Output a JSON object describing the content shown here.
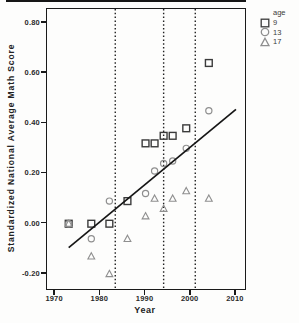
{
  "figure": {
    "y_axis_title": "Standardized National Average Math Score",
    "x_axis_title": "Year",
    "legend": {
      "title": "age",
      "items": [
        {
          "marker": "square",
          "label": "9",
          "color": "#3b3b3b"
        },
        {
          "marker": "circle",
          "label": "13",
          "color": "#8f8f8f"
        },
        {
          "marker": "triangle",
          "label": "17",
          "color": "#8f8f8f"
        }
      ]
    }
  },
  "chart_data": {
    "type": "scatter",
    "title": "",
    "xlabel": "Year",
    "ylabel": "Standardized National Average Math Score",
    "xlim": [
      1968.2,
      2012
    ],
    "ylim": [
      -0.26,
      0.855
    ],
    "xticks": [
      1970,
      1980,
      1990,
      2000,
      2010
    ],
    "xtick_labels": [
      "1970",
      "1980",
      "1990",
      "2000",
      "2010"
    ],
    "yticks": [
      0.8,
      0.6,
      0.4,
      0.2,
      0.0,
      -0.2
    ],
    "ytick_labels": [
      "0.80",
      "0.60",
      "0.40",
      "0.20",
      "0.00",
      "-0.20"
    ],
    "grid": false,
    "legend_position": "top-right-outside",
    "series": [
      {
        "name": "9",
        "marker": "square",
        "color": "#3b3b3b",
        "points": [
          [
            1973,
            0.0
          ],
          [
            1978,
            0.0
          ],
          [
            1982,
            0.0
          ],
          [
            1986,
            0.09
          ],
          [
            1990,
            0.32
          ],
          [
            1992,
            0.32
          ],
          [
            1994,
            0.35
          ],
          [
            1996,
            0.35
          ],
          [
            1999,
            0.38
          ],
          [
            2004,
            0.64
          ]
        ]
      },
      {
        "name": "13",
        "marker": "circle",
        "color": "#8f8f8f",
        "points": [
          [
            1973,
            0.0
          ],
          [
            1978,
            -0.06
          ],
          [
            1982,
            0.09
          ],
          [
            1990,
            0.12
          ],
          [
            1992,
            0.21
          ],
          [
            1994,
            0.24
          ],
          [
            1996,
            0.25
          ],
          [
            1999,
            0.3
          ],
          [
            2004,
            0.45
          ]
        ]
      },
      {
        "name": "17",
        "marker": "triangle",
        "color": "#8f8f8f",
        "points": [
          [
            1973,
            0.0
          ],
          [
            1978,
            -0.13
          ],
          [
            1982,
            -0.2
          ],
          [
            1986,
            -0.06
          ],
          [
            1990,
            0.03
          ],
          [
            1992,
            0.1
          ],
          [
            1994,
            0.06
          ],
          [
            1996,
            0.1
          ],
          [
            1999,
            0.13
          ],
          [
            2004,
            0.1
          ]
        ]
      }
    ],
    "trend_line": {
      "x1": 1973,
      "y1": -0.095,
      "x2": 2010,
      "y2": 0.455
    },
    "reference_lines_x": [
      1983.3,
      1994,
      2001
    ]
  }
}
